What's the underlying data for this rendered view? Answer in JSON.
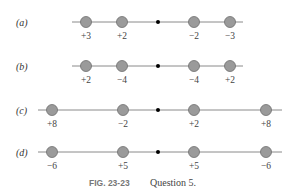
{
  "figure": {
    "caption_label": "FIG. 23-23",
    "caption_text": "Question 5.",
    "colors": {
      "particle_fill": "#9a9a9a",
      "particle_stroke": "#6e6e6e",
      "line": "#8a8a8a",
      "center_dot": "#000000"
    },
    "rows": [
      {
        "label": "(a)",
        "y": 22,
        "line_x": [
          72,
          243
        ],
        "center_x": 158,
        "particles": [
          {
            "x": 86,
            "charge": "+3"
          },
          {
            "x": 122,
            "charge": "+2"
          },
          {
            "x": 194,
            "charge": "−2"
          },
          {
            "x": 230,
            "charge": "−3"
          }
        ]
      },
      {
        "label": "(b)",
        "y": 66,
        "line_x": [
          72,
          243
        ],
        "center_x": 158,
        "particles": [
          {
            "x": 86,
            "charge": "+2"
          },
          {
            "x": 122,
            "charge": "−4"
          },
          {
            "x": 194,
            "charge": "−4"
          },
          {
            "x": 230,
            "charge": "+2"
          }
        ]
      },
      {
        "label": "(c)",
        "y": 110,
        "line_x": [
          38,
          282
        ],
        "center_x": 158,
        "particles": [
          {
            "x": 52,
            "charge": "+8"
          },
          {
            "x": 123,
            "charge": "−2"
          },
          {
            "x": 194,
            "charge": "+2"
          },
          {
            "x": 266,
            "charge": "+8"
          }
        ]
      },
      {
        "label": "(d)",
        "y": 152,
        "line_x": [
          38,
          282
        ],
        "center_x": 158,
        "particles": [
          {
            "x": 52,
            "charge": "−6"
          },
          {
            "x": 123,
            "charge": "+5"
          },
          {
            "x": 194,
            "charge": "+5"
          },
          {
            "x": 266,
            "charge": "−6"
          }
        ]
      }
    ]
  }
}
